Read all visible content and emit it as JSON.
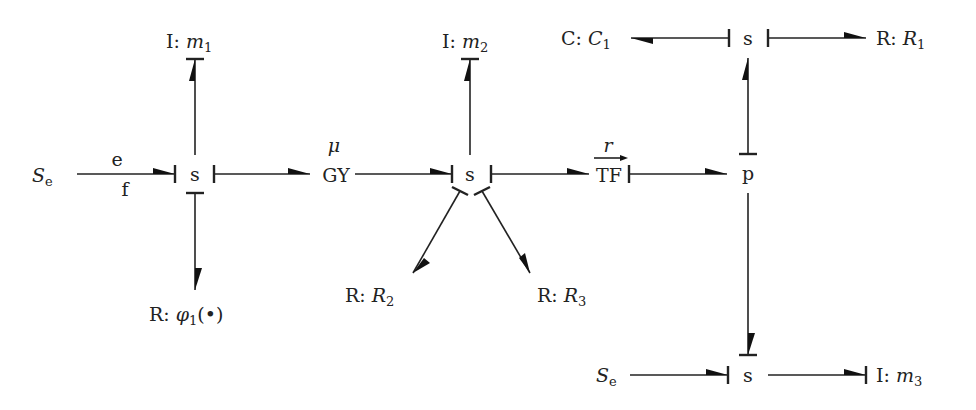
{
  "diagram": {
    "type": "bond-graph",
    "nodes": {
      "se1": {
        "prefix": "",
        "symbol": "S",
        "subscript": "e"
      },
      "s1": {
        "label": "s"
      },
      "i_m1": {
        "prefix": "I: ",
        "symbol": "m",
        "subscript": "1"
      },
      "r_phi1": {
        "prefix": "R: ",
        "symbol": "φ",
        "subscript": "1",
        "suffix": "(•)"
      },
      "gy": {
        "label": "GY",
        "parameter": "μ"
      },
      "s2": {
        "label": "s"
      },
      "i_m2": {
        "prefix": "I: ",
        "symbol": "m",
        "subscript": "2"
      },
      "r_r2": {
        "prefix": "R: ",
        "symbol": "R",
        "subscript": "2"
      },
      "r_r3": {
        "prefix": "R: ",
        "symbol": "R",
        "subscript": "3"
      },
      "tf": {
        "label": "TF",
        "parameter": "r"
      },
      "p": {
        "label": "p"
      },
      "s3": {
        "label": "s"
      },
      "c_c1": {
        "prefix": "C: ",
        "symbol": "C",
        "subscript": "1"
      },
      "r_r1": {
        "prefix": "R: ",
        "symbol": "R",
        "subscript": "1"
      },
      "se2": {
        "prefix": "",
        "symbol": "S",
        "subscript": "e"
      },
      "s4": {
        "label": "s"
      },
      "i_m3": {
        "prefix": "I: ",
        "symbol": "m",
        "subscript": "3"
      }
    },
    "bond_annotations": {
      "effort": "e",
      "flow": "f"
    },
    "bonds": [
      {
        "from": "se1",
        "to": "s1",
        "causal_stroke": "to"
      },
      {
        "from": "s1",
        "to": "i_m1",
        "causal_stroke": "to"
      },
      {
        "from": "s1",
        "to": "r_phi1",
        "causal_stroke": "from"
      },
      {
        "from": "s1",
        "to": "gy",
        "causal_stroke": "from"
      },
      {
        "from": "gy",
        "to": "s2",
        "causal_stroke": "to"
      },
      {
        "from": "s2",
        "to": "i_m2",
        "causal_stroke": "to"
      },
      {
        "from": "s2",
        "to": "r_r2",
        "causal_stroke": "from"
      },
      {
        "from": "s2",
        "to": "r_r3",
        "causal_stroke": "from"
      },
      {
        "from": "s2",
        "to": "tf",
        "causal_stroke": "from"
      },
      {
        "from": "tf",
        "to": "p",
        "causal_stroke": "from"
      },
      {
        "from": "p",
        "to": "s3",
        "causal_stroke": "from"
      },
      {
        "from": "s3",
        "to": "c_c1",
        "causal_stroke": "from"
      },
      {
        "from": "s3",
        "to": "r_r1",
        "causal_stroke": "from"
      },
      {
        "from": "p",
        "to": "s4",
        "causal_stroke": "to"
      },
      {
        "from": "se2",
        "to": "s4",
        "causal_stroke": "to"
      },
      {
        "from": "s4",
        "to": "i_m3",
        "causal_stroke": "to"
      }
    ]
  }
}
